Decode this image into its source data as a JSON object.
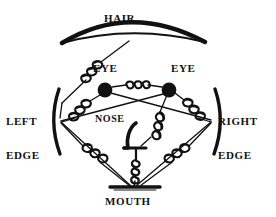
{
  "diagram": {
    "stroke_color": "#111111",
    "background_color": "#ffffff",
    "nodes": [
      {
        "id": "hair",
        "label": "HAIR",
        "shape": "arc",
        "x": 128,
        "y": 40
      },
      {
        "id": "eye_left",
        "label": "EYE",
        "shape": "disc",
        "x": 105,
        "y": 90
      },
      {
        "id": "eye_right",
        "label": "EYE",
        "shape": "disc",
        "x": 169,
        "y": 90
      },
      {
        "id": "left_edge",
        "label": "LEFT\nEDGE",
        "shape": "bracket",
        "x": 55,
        "y": 120
      },
      {
        "id": "right_edge",
        "label": "RIGHT\nEDGE",
        "shape": "bracket",
        "x": 216,
        "y": 120
      },
      {
        "id": "nose",
        "label": "NOSE",
        "shape": "profile",
        "x": 131,
        "y": 142
      },
      {
        "id": "mouth",
        "label": "MOUTH",
        "shape": "bar",
        "x": 133,
        "y": 186
      }
    ],
    "springs": [
      {
        "from": "hair",
        "to": "left_edge",
        "type": "spring"
      },
      {
        "from": "eye_left",
        "to": "eye_right",
        "type": "spring"
      },
      {
        "from": "eye_left",
        "to": "left_edge",
        "type": "spring"
      },
      {
        "from": "eye_right",
        "to": "right_edge",
        "type": "spring"
      },
      {
        "from": "nose",
        "to": "eye_right",
        "type": "spring"
      },
      {
        "from": "nose",
        "to": "mouth",
        "type": "spring"
      },
      {
        "from": "left_edge",
        "to": "mouth",
        "type": "spring"
      },
      {
        "from": "right_edge",
        "to": "mouth",
        "type": "spring"
      }
    ],
    "rigid_links": [
      {
        "from": "eye_left",
        "to": "right_edge"
      },
      {
        "from": "eye_right",
        "to": "left_edge"
      },
      {
        "from": "left_edge",
        "to": "mouth"
      },
      {
        "from": "right_edge",
        "to": "mouth"
      }
    ],
    "labels": {
      "hair": "HAIR",
      "eye_left": "EYE",
      "eye_right": "EYE",
      "left_edge_line1": "LEFT",
      "left_edge_line2": "EDGE",
      "right_edge_line1": "RIGHT",
      "right_edge_line2": "EDGE",
      "nose": "NOSE",
      "mouth": "MOUTH"
    }
  }
}
